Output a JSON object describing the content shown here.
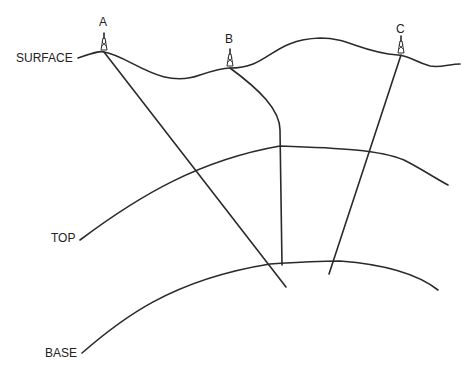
{
  "diagram": {
    "horizons": {
      "surface": "SURFACE",
      "top": "TOP",
      "base": "BASE"
    },
    "wells": [
      {
        "label": "A",
        "type": "slanted"
      },
      {
        "label": "B",
        "type": "curved-then-vertical"
      },
      {
        "label": "C",
        "type": "slanted"
      }
    ],
    "icons": {
      "well": "derrick-icon"
    },
    "colors": {
      "line": "#2a2a2a",
      "background": "#ffffff"
    }
  }
}
